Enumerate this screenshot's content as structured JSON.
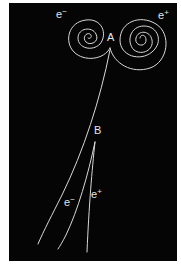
{
  "figure": {
    "title": "",
    "background_color": "#050505",
    "track_color": "#d8d8d8",
    "labels": {
      "top_electron": {
        "base": "e",
        "sign": "−"
      },
      "top_positron": {
        "base": "e",
        "sign": "+"
      },
      "vertex_a": "A",
      "vertex_b": "B",
      "bottom_electron": {
        "base": "e",
        "sign": "−"
      },
      "bottom_positron": {
        "base": "e",
        "sign": "+"
      }
    }
  }
}
